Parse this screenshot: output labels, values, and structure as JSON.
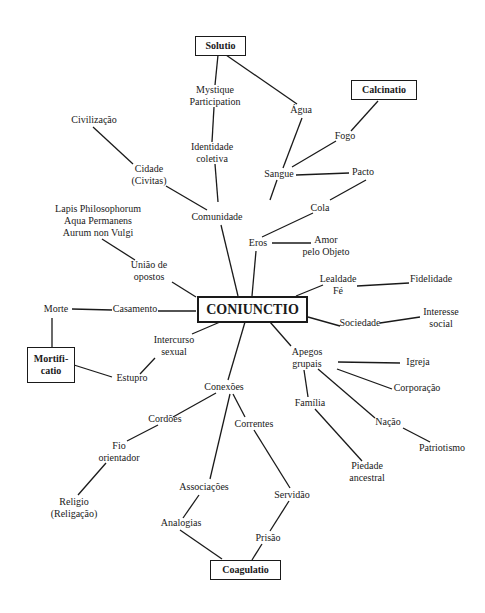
{
  "diagram": {
    "center": "CONIUNCTIO",
    "operations": {
      "solutio": "Solutio",
      "calcinatio": "Calcinatio",
      "mortificatio_1": "Mortifi-",
      "mortificatio_2": "catio",
      "coagulatio": "Coagulatio"
    },
    "nodes": {
      "mystique_1": "Mystique",
      "mystique_2": "Participation",
      "agua": "Água",
      "fogo": "Fogo",
      "civilizacao": "Civilização",
      "identidade_1": "Identidade",
      "identidade_2": "coletiva",
      "cidade_1": "Cidade",
      "cidade_2": "(Civitas)",
      "sangue": "Sangue",
      "pacto": "Pacto",
      "comunidade": "Comunidade",
      "cola": "Cola",
      "lapis_1": "Lapis Philosophorum",
      "lapis_2": "Aqua Permanens",
      "lapis_3": "Aurum non Vulgi",
      "eros": "Eros",
      "amor_1": "Amor",
      "amor_2": "pelo Objeto",
      "uniao_1": "União de",
      "uniao_2": "opostos",
      "lealdade_1": "Lealdade",
      "lealdade_2": "Fé",
      "fidelidade": "Fidelidade",
      "morte": "Morte",
      "casamento": "Casamento",
      "sociedade": "Sociedade",
      "interesse_1": "Interesse",
      "interesse_2": "social",
      "intercurso_1": "Intercurso",
      "intercurso_2": "sexual",
      "estupro": "Estupro",
      "apegos_1": "Apegos",
      "apegos_2": "grupais",
      "igreja": "Igreja",
      "corporacao": "Corporação",
      "conexoes": "Conexões",
      "familia": "Família",
      "cordoes": "Cordões",
      "correntes": "Correntes",
      "nacao": "Nação",
      "patriotismo": "Patriotismo",
      "fio_1": "Fio",
      "fio_2": "orientador",
      "piedade_1": "Piedade",
      "piedade_2": "ancestral",
      "associacoes": "Associações",
      "servidao": "Servidão",
      "religio_1": "Religio",
      "religio_2": "(Religação)",
      "analogias": "Analogias",
      "prisao": "Prisão"
    }
  }
}
